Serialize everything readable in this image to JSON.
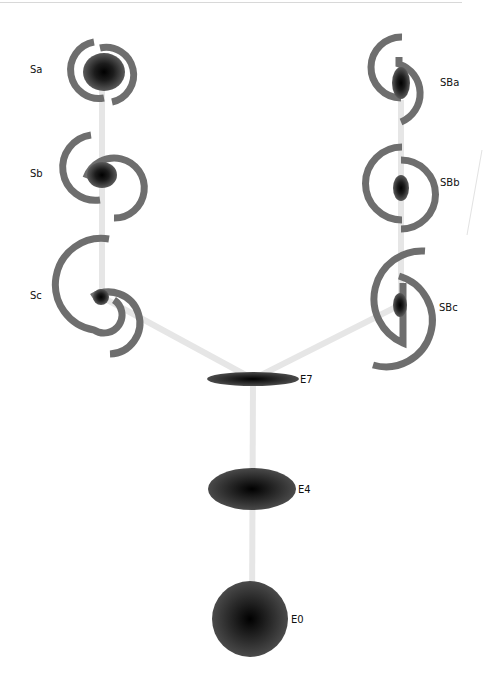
{
  "diagram": {
    "colors": {
      "arm": "#6e6e6e",
      "connector": "#e6e6e6",
      "core": "#000000",
      "label": "#111111",
      "top_rule": "#d8d8d8"
    },
    "elliptical": [
      {
        "label": "E7",
        "cx": 253,
        "cy": 379,
        "rx": 46,
        "ry": 7
      },
      {
        "label": "E4",
        "cx": 252,
        "cy": 489,
        "rx": 44,
        "ry": 21
      },
      {
        "label": "E0",
        "cx": 250,
        "cy": 618,
        "rx": 38,
        "ry": 37
      }
    ],
    "spirals": [
      {
        "label": "Sa",
        "cx": 102,
        "cy": 70
      },
      {
        "label": "Sb",
        "cx": 102,
        "cy": 174
      },
      {
        "label": "Sc",
        "cx": 100,
        "cy": 296
      }
    ],
    "barred_spirals": [
      {
        "label": "SBa",
        "cx": 401,
        "cy": 83
      },
      {
        "label": "SBb",
        "cx": 401,
        "cy": 188
      },
      {
        "label": "SBc",
        "cx": 400,
        "cy": 305
      }
    ]
  }
}
